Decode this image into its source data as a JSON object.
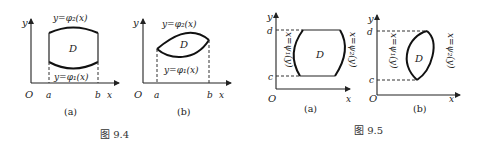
{
  "figure_9_4": {
    "caption": "图 9.4",
    "panel_a": {
      "sublabel": "(a)",
      "axis_y": "y",
      "axis_x": "x",
      "origin": "O",
      "tick_a": "a",
      "tick_b": "b",
      "region": "D",
      "upper_curve": "y=φ₂(x)",
      "lower_curve": "y=φ₁(x)"
    },
    "panel_b": {
      "sublabel": "(b)",
      "axis_y": "y",
      "axis_x": "x",
      "origin": "O",
      "tick_a": "a",
      "tick_b": "b",
      "region": "D",
      "upper_curve": "y=φ₂(x)",
      "lower_curve": "y=φ₁(x)"
    }
  },
  "figure_9_5": {
    "caption": "图 9.5",
    "panel_a": {
      "sublabel": "(a)",
      "axis_y": "y",
      "axis_x": "x",
      "origin": "O",
      "tick_c": "c",
      "tick_d": "d",
      "region": "D",
      "left_curve": "x=ψ₁(y)",
      "right_curve": "x=ψ₂(y)"
    },
    "panel_b": {
      "sublabel": "(b)",
      "axis_y": "y",
      "axis_x": "x",
      "origin": "O",
      "tick_c": "c",
      "tick_d": "d",
      "region": "D",
      "left_curve": "x=ψ₁(y)",
      "right_curve": "x=ψ₂(y)"
    }
  }
}
